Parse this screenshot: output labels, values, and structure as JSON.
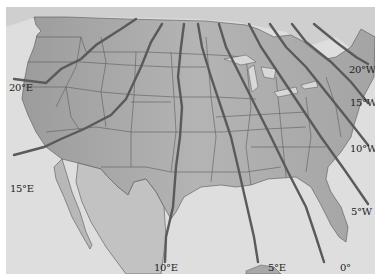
{
  "map": {
    "type": "isogonic-declination-map",
    "region": "Contiguous United States",
    "colors": {
      "ocean": "#dcdcdc",
      "land": "#a9a9a9",
      "land_light": "#bdbdbd",
      "state_border": "#555555",
      "isogonic_line": "#5a5a5a",
      "label": "#222222"
    },
    "isogonic_lines": [
      {
        "id": "20E",
        "label": "20°E"
      },
      {
        "id": "15E",
        "label": "15°E"
      },
      {
        "id": "10E",
        "label": "10°E"
      },
      {
        "id": "5E",
        "label": "5°E"
      },
      {
        "id": "0",
        "label": "0°"
      },
      {
        "id": "5W",
        "label": "5°W"
      },
      {
        "id": "10W",
        "label": "10°W"
      },
      {
        "id": "15W",
        "label": "15°W"
      },
      {
        "id": "20W",
        "label": "20°W"
      }
    ]
  }
}
